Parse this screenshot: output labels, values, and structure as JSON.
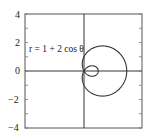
{
  "chart_data": {
    "type": "line",
    "subtype": "polar-curve",
    "title": "",
    "annotation": "r = 1 + 2 cos θ",
    "equation": "r = 1 + 2 cos θ",
    "xlabel": "",
    "ylabel": "",
    "xlim": [
      -4,
      4
    ],
    "ylim": [
      -4,
      4
    ],
    "y_ticks": [
      4,
      2,
      0,
      -2,
      -4
    ],
    "y_tick_labels": [
      "4",
      "2",
      "0",
      "−2",
      "−4"
    ],
    "grid": false,
    "axes_lines_through_origin": true,
    "series": [
      {
        "name": "r = 1 + 2 cos θ",
        "description": "Limaçon with inner loop; outer loop reaches x=3, inner loop spans x 0..1",
        "key_points": [
          {
            "theta_deg": 0,
            "x": 3,
            "y": 0
          },
          {
            "theta_deg": 90,
            "x": 0,
            "y": 1
          },
          {
            "theta_deg": 120,
            "x": 0,
            "y": 0
          },
          {
            "theta_deg": 180,
            "x": 1,
            "y": 0
          },
          {
            "theta_deg": 240,
            "x": 0,
            "y": 0
          },
          {
            "theta_deg": 270,
            "x": 0,
            "y": -1
          }
        ],
        "color": "#333333"
      }
    ]
  },
  "labels": {
    "equation": "r = 1 + 2 cos θ",
    "y4": "4",
    "y2": "2",
    "y0": "0",
    "ym2": "−2",
    "ym4": "−4"
  }
}
